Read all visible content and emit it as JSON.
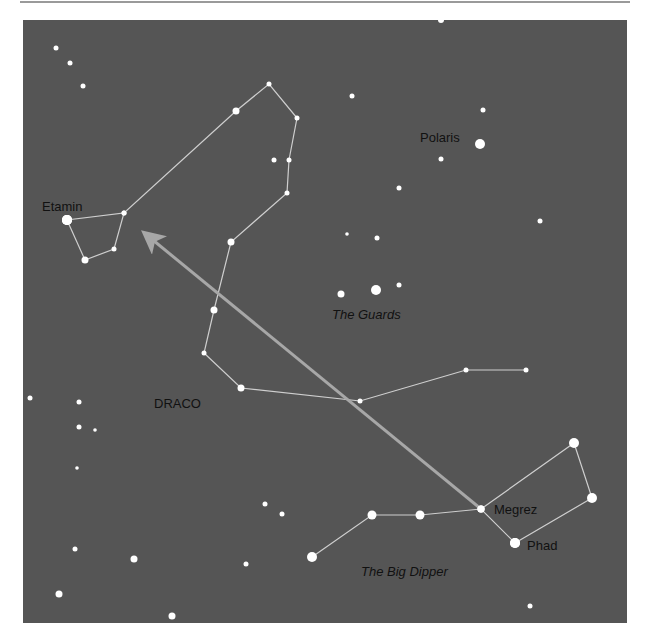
{
  "map": {
    "title": "Finding Polaris from the Big Dipper",
    "colors": {
      "background": "#ffffff",
      "sky": "#555555",
      "star": "#ffffff",
      "constellation_line": "#cfcfcf",
      "pointer_arrow": "#a7a7a7",
      "label": "#111111"
    }
  },
  "labels": {
    "etamin": "Etamin",
    "polaris": "Polaris",
    "guards": "The Guards",
    "draco": "DRACO",
    "megrez": "Megrez",
    "phad": "Phad",
    "big_dipper": "The Big Dipper"
  },
  "stars": [
    {
      "name": "Etamin",
      "x": 67,
      "y": 220,
      "r": 5
    },
    {
      "name": "Polaris",
      "x": 480,
      "y": 144,
      "r": 5
    },
    {
      "name": "Megrez",
      "x": 481,
      "y": 509,
      "r": 3.5
    },
    {
      "name": "Phad",
      "x": 515,
      "y": 543,
      "r": 5
    },
    {
      "name": "",
      "x": 56,
      "y": 48,
      "r": 2.5
    },
    {
      "name": "",
      "x": 70,
      "y": 63,
      "r": 2.5
    },
    {
      "name": "",
      "x": 83,
      "y": 86,
      "r": 2.5
    },
    {
      "name": "",
      "x": 441,
      "y": 20,
      "r": 3
    },
    {
      "name": "",
      "x": 352,
      "y": 96,
      "r": 2.5
    },
    {
      "name": "",
      "x": 483,
      "y": 110,
      "r": 2.5
    },
    {
      "name": "",
      "x": 441,
      "y": 159,
      "r": 2.5
    },
    {
      "name": "",
      "x": 399,
      "y": 188,
      "r": 2.5
    },
    {
      "name": "",
      "x": 540,
      "y": 221,
      "r": 2.5
    },
    {
      "name": "",
      "x": 377,
      "y": 238,
      "r": 2.5
    },
    {
      "name": "",
      "x": 347,
      "y": 234,
      "r": 1.8
    },
    {
      "name": "",
      "x": 376,
      "y": 290,
      "r": 5
    },
    {
      "name": "",
      "x": 341,
      "y": 294,
      "r": 3.5
    },
    {
      "name": "",
      "x": 399,
      "y": 285,
      "r": 2.5
    },
    {
      "name": "",
      "x": 30,
      "y": 398,
      "r": 2.5
    },
    {
      "name": "",
      "x": 79,
      "y": 402,
      "r": 2.5
    },
    {
      "name": "",
      "x": 79,
      "y": 427,
      "r": 2.5
    },
    {
      "name": "",
      "x": 95,
      "y": 430,
      "r": 1.8
    },
    {
      "name": "",
      "x": 77,
      "y": 468,
      "r": 1.8
    },
    {
      "name": "",
      "x": 265,
      "y": 504,
      "r": 2.5
    },
    {
      "name": "",
      "x": 282,
      "y": 514,
      "r": 2.5
    },
    {
      "name": "",
      "x": 75,
      "y": 549,
      "r": 2.5
    },
    {
      "name": "",
      "x": 134,
      "y": 559,
      "r": 3.5
    },
    {
      "name": "",
      "x": 246,
      "y": 564,
      "r": 2.5
    },
    {
      "name": "",
      "x": 59,
      "y": 594,
      "r": 3.5
    },
    {
      "name": "",
      "x": 172,
      "y": 616,
      "r": 3.5
    },
    {
      "name": "",
      "x": 530,
      "y": 606,
      "r": 2.5
    },
    {
      "name": "",
      "x": 274,
      "y": 160,
      "r": 2.5
    }
  ],
  "constellations": [
    {
      "name": "Draco",
      "points": [
        [
          67,
          220
        ],
        [
          124,
          213
        ],
        [
          114,
          249
        ],
        [
          85,
          260
        ],
        [
          67,
          220
        ],
        [
          124,
          213
        ],
        [
          236,
          111
        ],
        [
          269,
          84
        ],
        [
          297,
          118
        ],
        [
          289,
          160
        ],
        [
          287,
          193
        ],
        [
          231,
          242
        ],
        [
          214,
          310
        ],
        [
          204,
          353
        ],
        [
          241,
          388
        ],
        [
          360,
          401
        ],
        [
          466,
          370
        ],
        [
          526,
          370
        ]
      ],
      "star_radii": [
        5,
        2.5,
        2.5,
        3.5,
        5,
        2.5,
        3.5,
        2.5,
        2.5,
        2.5,
        2.5,
        3.5,
        3.5,
        2.5,
        3.5,
        2.5,
        2.5,
        2.5
      ]
    },
    {
      "name": "The Big Dipper",
      "points": [
        [
          312,
          557
        ],
        [
          372,
          515
        ],
        [
          420,
          515
        ],
        [
          481,
          509
        ],
        [
          515,
          543
        ],
        [
          592,
          498
        ],
        [
          574,
          443
        ],
        [
          481,
          509
        ]
      ],
      "star_radii": [
        5,
        4.5,
        4.5,
        3.5,
        5,
        5,
        5,
        3.5
      ]
    }
  ],
  "pointer_arrow": {
    "from": [
      481,
      509
    ],
    "to": [
      148,
      236
    ]
  }
}
